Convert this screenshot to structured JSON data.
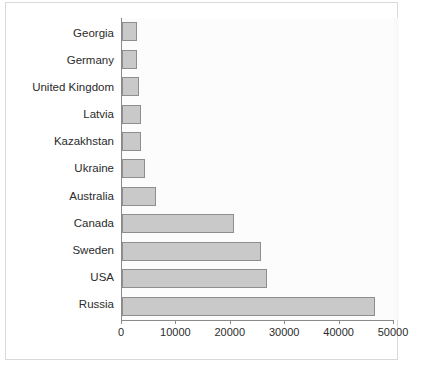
{
  "chart_data": {
    "type": "bar",
    "orientation": "horizontal",
    "title": "",
    "subtitle": "",
    "xlabel": "",
    "ylabel": "",
    "categories": [
      "Georgia",
      "Germany",
      "United Kingdom",
      "Latvia",
      "Kazakhstan",
      "Ukraine",
      "Australia",
      "Canada",
      "Sweden",
      "USA",
      "Russia"
    ],
    "values": [
      2700,
      2750,
      3100,
      3500,
      3500,
      4200,
      6200,
      20600,
      25500,
      26700,
      46500
    ],
    "series": [
      {
        "name": "",
        "values": [
          2700,
          2750,
          3100,
          3500,
          3500,
          4200,
          6200,
          20600,
          25500,
          26700,
          46500
        ]
      }
    ],
    "xlim": [
      0,
      50000
    ],
    "xticks": [
      0,
      10000,
      20000,
      30000,
      40000,
      50000
    ],
    "xtick_labels": [
      "0",
      "10000",
      "20000",
      "30000",
      "40000",
      "50000"
    ],
    "grid": false,
    "legend": null,
    "bar_color": "#c9c9c9",
    "bar_border_color": "#8e8e8e",
    "axis_color": "#8a8a8a",
    "plot_background": "#fcfcfc",
    "text_color": "#2b2b2b"
  }
}
